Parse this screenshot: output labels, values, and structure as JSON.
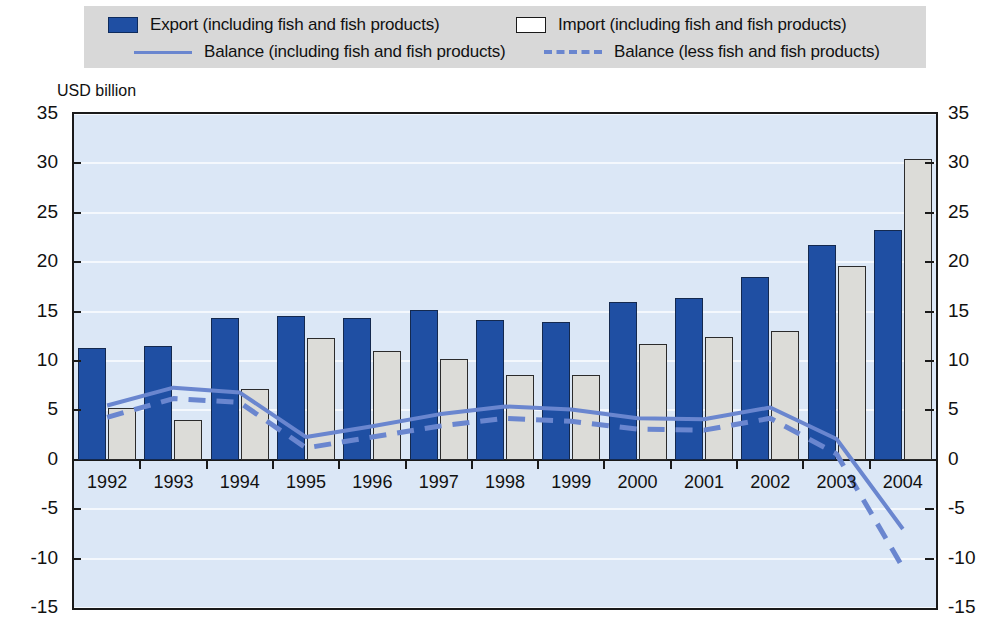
{
  "unit_label": "USD billion",
  "legend": {
    "items": [
      {
        "key": "export",
        "label": "Export (including fish and fish products)",
        "swatch": "filled-blue-box",
        "color": "#1f4fa3"
      },
      {
        "key": "import",
        "label": "Import (including fish and fish products)",
        "swatch": "white-box",
        "color": "#ffffff"
      },
      {
        "key": "balance_incl",
        "label": "Balance (including fish and fish products)",
        "swatch": "solid-line",
        "color": "#6a86cf"
      },
      {
        "key": "balance_less",
        "label": "Balance (less fish and fish products)",
        "swatch": "dashed-line",
        "color": "#6a86cf"
      }
    ]
  },
  "colors": {
    "export_bar": "#1f4fa3",
    "import_bar": "#dcdcd8",
    "balance_line": "#6a86cf",
    "plot_background": "#dbe7f6",
    "legend_background": "#d8d8d8",
    "gridline": "#f4f8fd",
    "axis": "#1a1a1a"
  },
  "chart_data": {
    "type": "bar",
    "title": "",
    "subtitle": "",
    "xlabel": "",
    "ylabel": "USD billion",
    "ylim": [
      -15,
      35
    ],
    "yticks": [
      35,
      30,
      25,
      20,
      15,
      10,
      5,
      0,
      -5,
      -10,
      -15
    ],
    "ytick_labels": [
      "35",
      "30",
      "25",
      "20",
      "15",
      "10",
      "5",
      "0",
      "-5",
      "-10",
      "-15"
    ],
    "grid": true,
    "legend_position": "top",
    "dual_y_axis": true,
    "categories": [
      "1992",
      "1993",
      "1994",
      "1995",
      "1996",
      "1997",
      "1998",
      "1999",
      "2000",
      "2001",
      "2002",
      "2003",
      "2004"
    ],
    "series": [
      {
        "name": "Export (including fish and fish products)",
        "type": "bar",
        "color": "#1f4fa3",
        "values": [
          11.3,
          11.5,
          14.4,
          14.6,
          14.4,
          15.2,
          14.2,
          13.9,
          16.0,
          16.4,
          18.5,
          21.7,
          23.3
        ]
      },
      {
        "name": "Import (including fish and fish products)",
        "type": "bar",
        "color": "#dcdcd8",
        "values": [
          5.2,
          4.0,
          7.2,
          12.3,
          11.0,
          10.2,
          8.6,
          8.6,
          11.7,
          12.4,
          13.0,
          19.6,
          30.4
        ]
      },
      {
        "name": "Balance (including fish and fish products)",
        "type": "line",
        "style": "solid",
        "color": "#6a86cf",
        "values": [
          5.5,
          7.3,
          6.8,
          2.3,
          3.4,
          4.6,
          5.4,
          5.1,
          4.2,
          4.1,
          5.3,
          2.1,
          -7.0
        ]
      },
      {
        "name": "Balance (less fish and fish products)",
        "type": "line",
        "style": "dashed",
        "color": "#6a86cf",
        "values": [
          4.3,
          6.2,
          5.8,
          1.2,
          2.3,
          3.4,
          4.2,
          3.9,
          3.1,
          3.0,
          4.2,
          0.6,
          -10.9
        ]
      }
    ]
  }
}
